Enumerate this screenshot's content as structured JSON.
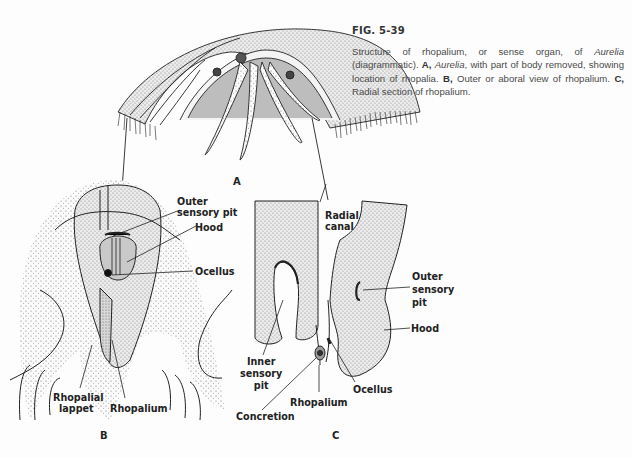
{
  "caption": {
    "figure_number": "FIG. 5-39",
    "intro": "Structure of rhopalium, or sense organ, of ",
    "genus": "Aurelia",
    "intro_end": " (diagrammatic). ",
    "a_key": "A,",
    "a_genus": "Aurelia",
    "a_text": ", with part of body removed, showing location of rhopalia. ",
    "b_key": "B,",
    "b_text": " Outer or aboral view of rhopalium. ",
    "c_key": "C,",
    "c_text": " Radial section of rhopalium."
  },
  "panels": {
    "a": "A",
    "b": "B",
    "c": "C"
  },
  "labels_b": {
    "outer_sensory_pit_1": "Outer",
    "outer_sensory_pit_2": "sensory pit",
    "hood": "Hood",
    "ocellus": "Ocellus",
    "rhopalial_lappet_1": "Rhopalial",
    "rhopalial_lappet_2": "lappet",
    "rhopalium": "Rhopalium"
  },
  "labels_c": {
    "radial_canal_1": "Radial",
    "radial_canal_2": "canal",
    "outer_sensory_pit_1": "Outer",
    "outer_sensory_pit_2": "sensory",
    "outer_sensory_pit_3": "pit",
    "hood": "Hood",
    "inner_sensory_pit_1": "Inner",
    "inner_sensory_pit_2": "sensory",
    "inner_sensory_pit_3": "pit",
    "ocellus": "Ocellus",
    "rhopalium": "Rhopalium",
    "concretion": "Concretion"
  },
  "colors": {
    "ink": "#1e1e1e",
    "stipple_fill": "#dcdcdc",
    "dark_fill": "#9a9a9a",
    "caption_text": "#4a4a4a"
  }
}
